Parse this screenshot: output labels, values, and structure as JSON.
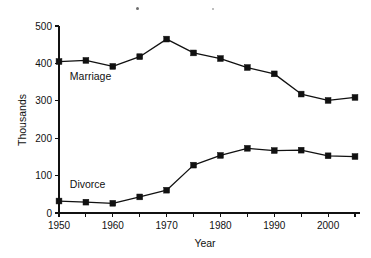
{
  "chart_data": {
    "type": "line",
    "title": "",
    "xlabel": "Year",
    "ylabel": "Thousands",
    "xlim": [
      1950,
      2005
    ],
    "ylim": [
      0,
      500
    ],
    "grid": false,
    "legend_position": "inline-labels",
    "x": [
      1950,
      1955,
      1960,
      1965,
      1970,
      1975,
      1980,
      1985,
      1990,
      1995,
      2000,
      2005
    ],
    "xticks_major": [
      1950,
      1960,
      1970,
      1980,
      1990,
      2000
    ],
    "xticks_minor": [
      1955,
      1965,
      1975,
      1985,
      1995,
      2005
    ],
    "xtick_labels": [
      "1950",
      "1960",
      "1970",
      "1980",
      "1990",
      "2000"
    ],
    "yticks": [
      0,
      100,
      200,
      300,
      400,
      500
    ],
    "ytick_labels": [
      "0",
      "100",
      "200",
      "300",
      "400",
      "500"
    ],
    "marker": "square",
    "series": [
      {
        "name": "Marriage",
        "values": [
          405,
          408,
          392,
          418,
          465,
          428,
          413,
          389,
          372,
          318,
          301,
          309
        ],
        "label_x": 1952,
        "label_y": 355
      },
      {
        "name": "Divorce",
        "values": [
          32,
          29,
          26,
          43,
          61,
          128,
          154,
          173,
          167,
          168,
          153,
          151
        ],
        "label_x": 1952,
        "label_y": 68
      }
    ]
  },
  "figure": {
    "y_axis_title": "Thousands",
    "x_axis_title": "Year",
    "series_labels": {
      "marriage": "Marriage",
      "divorce": "Divorce"
    }
  }
}
